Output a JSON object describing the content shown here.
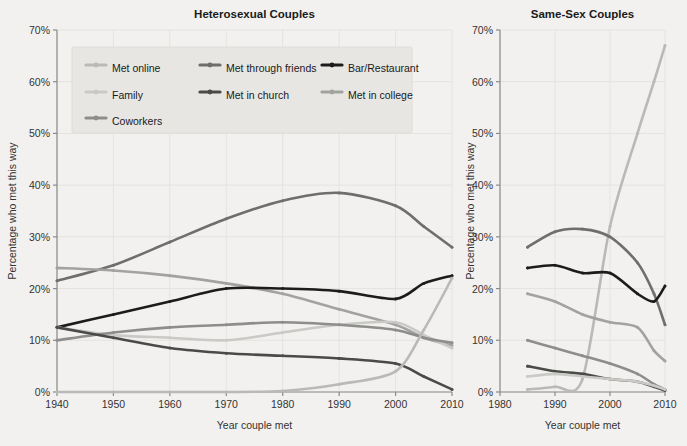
{
  "figure": {
    "background_color": "#f2f1ef",
    "width": 687,
    "height": 446
  },
  "panels": [
    {
      "id": "heterosexual",
      "title": "Heterosexual Couples"
    },
    {
      "id": "samesex",
      "title": "Same-Sex Couples"
    }
  ],
  "legend": {
    "position": "top-left-of-left-panel",
    "background_color": "#e7e6e3",
    "entries": [
      {
        "label": "Met online",
        "color": "#b9b9b7"
      },
      {
        "label": "Met through friends",
        "color": "#6e6e6c"
      },
      {
        "label": "Bar/Restaurant",
        "color": "#1c1c1c"
      },
      {
        "label": "Family",
        "color": "#c9c9c6"
      },
      {
        "label": "Met in church",
        "color": "#4a4a48"
      },
      {
        "label": "Met in college",
        "color": "#a2a2a0"
      },
      {
        "label": "Coworkers",
        "color": "#8d8d8b"
      }
    ]
  },
  "chart_data": [
    {
      "type": "line",
      "title": "Heterosexual Couples",
      "xlabel": "Year couple met",
      "ylabel": "Percentage who met this way",
      "xlim": [
        1940,
        2010
      ],
      "ylim": [
        0,
        70
      ],
      "xticks": [
        1940,
        1950,
        1960,
        1970,
        1980,
        1990,
        2000,
        2010
      ],
      "xticklabels": [
        "1940",
        "1950",
        "1960",
        "1970",
        "1980",
        "1990",
        "2000",
        "2010"
      ],
      "yticks": [
        0,
        10,
        20,
        30,
        40,
        50,
        60,
        70
      ],
      "yticklabels": [
        "0%",
        "10%",
        "20%",
        "30%",
        "40%",
        "50%",
        "60%",
        "70%"
      ],
      "grid": true,
      "legend_position": "upper left",
      "x": [
        1940,
        1950,
        1960,
        1970,
        1980,
        1990,
        2000,
        2005,
        2010
      ],
      "series": [
        {
          "name": "Met through friends",
          "color": "#6e6e6c",
          "values": [
            21.5,
            24.5,
            29.0,
            33.5,
            37.0,
            38.5,
            36.0,
            32.0,
            28.0
          ]
        },
        {
          "name": "Met in college",
          "color": "#a2a2a0",
          "values": [
            24.0,
            23.5,
            22.5,
            21.0,
            19.0,
            16.0,
            13.0,
            10.5,
            9.0
          ]
        },
        {
          "name": "Bar/Restaurant",
          "color": "#1c1c1c",
          "values": [
            12.5,
            15.0,
            17.5,
            20.0,
            20.0,
            19.5,
            18.0,
            21.0,
            22.5
          ]
        },
        {
          "name": "Family",
          "color": "#c9c9c6",
          "values": [
            12.5,
            11.0,
            10.5,
            10.0,
            11.5,
            13.0,
            13.5,
            11.0,
            8.5
          ]
        },
        {
          "name": "Coworkers",
          "color": "#8d8d8b",
          "values": [
            10.0,
            11.5,
            12.5,
            13.0,
            13.5,
            13.0,
            12.0,
            10.5,
            9.5
          ]
        },
        {
          "name": "Met in church",
          "color": "#4a4a48",
          "values": [
            12.5,
            10.5,
            8.5,
            7.5,
            7.0,
            6.5,
            5.5,
            3.0,
            0.5
          ]
        },
        {
          "name": "Met online",
          "color": "#b9b9b7",
          "values": [
            0.0,
            0.0,
            0.0,
            0.0,
            0.2,
            1.5,
            4.0,
            12.0,
            22.0
          ]
        }
      ]
    },
    {
      "type": "line",
      "title": "Same-Sex Couples",
      "xlabel": "Year couple met",
      "ylabel": "Percentage who met this way",
      "xlim": [
        1980,
        2010
      ],
      "ylim": [
        0,
        70
      ],
      "xticks": [
        1980,
        1990,
        2000,
        2010
      ],
      "xticklabels": [
        "1980",
        "1990",
        "2000",
        "2010"
      ],
      "yticks": [
        0,
        10,
        20,
        30,
        40,
        50,
        60,
        70
      ],
      "yticklabels": [
        "0%",
        "10%",
        "20%",
        "30%",
        "40%",
        "50%",
        "60%",
        "70%"
      ],
      "grid": true,
      "legend_position": "none",
      "x": [
        1985,
        1990,
        1995,
        2000,
        2005,
        2008,
        2010
      ],
      "series": [
        {
          "name": "Met online",
          "color": "#b9b9b7",
          "values": [
            0.5,
            1.0,
            2.5,
            32.0,
            50.0,
            60.0,
            67.0
          ]
        },
        {
          "name": "Met through friends",
          "color": "#6e6e6c",
          "values": [
            28.0,
            31.0,
            31.5,
            30.0,
            25.0,
            19.0,
            13.0
          ]
        },
        {
          "name": "Bar/Restaurant",
          "color": "#1c1c1c",
          "values": [
            24.0,
            24.5,
            23.0,
            23.0,
            19.0,
            17.5,
            20.5
          ]
        },
        {
          "name": "Met in college",
          "color": "#a2a2a0",
          "values": [
            19.0,
            17.5,
            15.0,
            13.5,
            12.5,
            8.0,
            6.0
          ]
        },
        {
          "name": "Coworkers",
          "color": "#8d8d8b",
          "values": [
            10.0,
            8.5,
            7.0,
            5.5,
            3.5,
            1.5,
            0.5
          ]
        },
        {
          "name": "Met in church",
          "color": "#4a4a48",
          "values": [
            5.0,
            4.0,
            3.5,
            2.5,
            2.0,
            1.0,
            0.3
          ]
        },
        {
          "name": "Family",
          "color": "#c9c9c6",
          "values": [
            3.0,
            3.5,
            3.0,
            2.5,
            2.0,
            1.2,
            0.5
          ]
        }
      ]
    }
  ]
}
